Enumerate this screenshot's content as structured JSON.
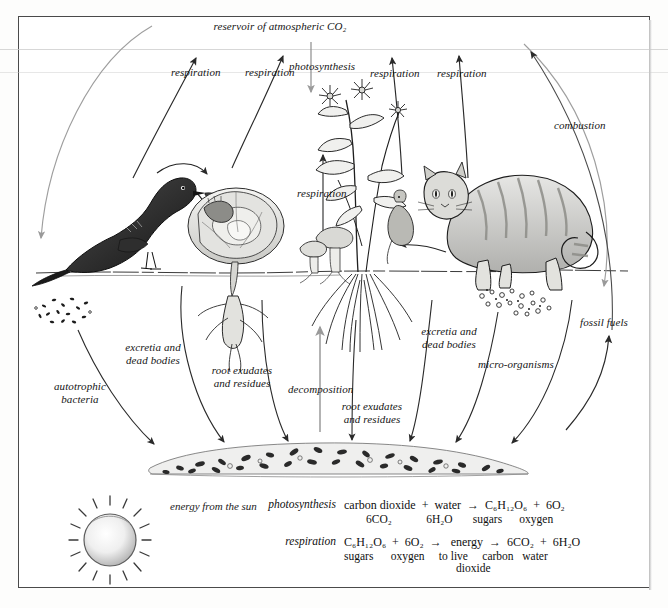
{
  "diagram": {
    "atmosphere_label": "reservoir of atmospheric CO₂",
    "photosynthesis_label": "photosynthesis",
    "respiration_labels": [
      "respiration",
      "respiration",
      "respiration",
      "respiration",
      "respiration"
    ],
    "combustion_label": "combustion",
    "fossil_fuels_label": "fossil fuels",
    "autotrophic_label": "autotrophic\nbacteria",
    "excretia_left_label": "excretia and\ndead bodies",
    "root_exudates_left_label": "root exudates\nand residues",
    "decomposition_label": "decomposition",
    "root_exudates_center_label": "root exudates\nand residues",
    "excretia_right_label": "excretia and\ndead bodies",
    "microorganisms_label": "micro-organisms",
    "energy_from_sun_label": "energy\nfrom\nthe sun"
  },
  "organisms": [
    {
      "name": "bird",
      "caption": "bird"
    },
    {
      "name": "caterpillar",
      "caption": "caterpillar"
    },
    {
      "name": "cabbage",
      "caption": "cabbage"
    },
    {
      "name": "mushrooms",
      "caption": "mushrooms"
    },
    {
      "name": "flowering-plant",
      "caption": "flowering plant"
    },
    {
      "name": "cat",
      "caption": "cat"
    },
    {
      "name": "soil-humus",
      "caption": "soil humus"
    },
    {
      "name": "sun",
      "caption": "sun"
    }
  ],
  "equations": {
    "photosynthesis": {
      "name": "photosynthesis",
      "line1": "carbon dioxide  +  water  →  C₆H₁₂O₆  +  6O₂",
      "line2": "6CO₂            6H₂O       sugars      oxygen"
    },
    "respiration": {
      "name": "respiration",
      "line1": "C₆H₁₂O₆  +  6O₂  →   energy  →  6CO₂  +  6H₂O",
      "line2": "sugars      oxygen     to live     carbon   water",
      "line3": "dioxide"
    }
  },
  "colors": {
    "ink": "#141414",
    "arrow": "#2a2a2a",
    "arrow_light": "#9a9a9a",
    "frame": "#4a4a4a",
    "paper": "#ffffff"
  }
}
